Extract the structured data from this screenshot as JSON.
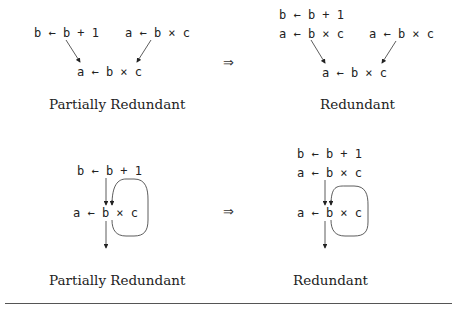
{
  "top": {
    "left": {
      "pred_left": "b ← b + 1",
      "pred_right": "a ← b × c",
      "target": "a ← b × c",
      "caption": "Partially Redundant"
    },
    "implies": "⇒",
    "right": {
      "pred_left_line1": "b ← b + 1",
      "pred_left_line2": "a ← b × c",
      "pred_right": "a ← b × c",
      "target": "a ← b × c",
      "caption": "Redundant"
    }
  },
  "bottom": {
    "left": {
      "pre": "b ← b + 1",
      "loop": "a ← b × c",
      "caption": "Partially Redundant"
    },
    "implies": "⇒",
    "right": {
      "pre_line1": "b ← b + 1",
      "pre_line2": "a ← b × c",
      "loop": "a ← b × c",
      "caption": "Redundant"
    }
  }
}
